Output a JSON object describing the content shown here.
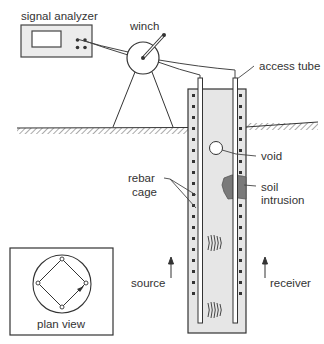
{
  "diagram": {
    "labels": {
      "signal_analyzer": "signal analyzer",
      "winch": "winch",
      "access_tube": "access tube",
      "rebar_cage_line1": "rebar",
      "rebar_cage_line2": "cage",
      "void": "void",
      "soil_intrusion_line1": "soil",
      "soil_intrusion_line2": "intrusion",
      "source": "source",
      "receiver": "receiver",
      "plan_view": "plan view"
    },
    "colors": {
      "line": "#333333",
      "shaft_fill": "#e6e6e6",
      "soil_intrusion": "#7a7a7a",
      "analyzer_fill": "#ececec"
    }
  }
}
